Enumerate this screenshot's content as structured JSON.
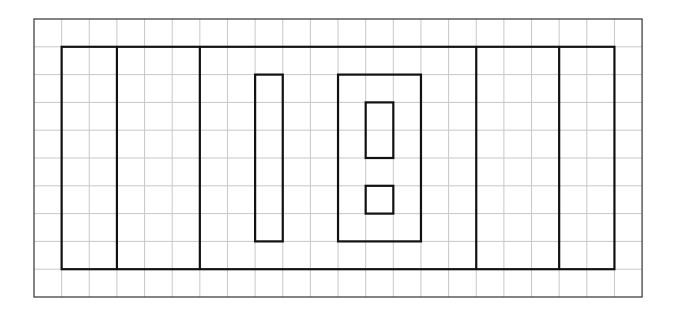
{
  "diagram": {
    "type": "grid-with-rectangles",
    "grid": {
      "origin_px": [
        34,
        19
      ],
      "cols": 22,
      "rows": 10,
      "cell_w": 27.64,
      "cell_h": 27.8,
      "line_color": "#c8c8c8",
      "border_color": "#333333"
    },
    "shape_stroke": "#111111",
    "shapes": [
      {
        "name": "outer-field-rect",
        "col": 1,
        "row": 1,
        "w": 20,
        "h": 8
      },
      {
        "name": "left-end-zone-divider",
        "type": "vline",
        "col": 3,
        "row": 1,
        "h": 8
      },
      {
        "name": "left-inner-divider",
        "type": "vline",
        "col": 6,
        "row": 1,
        "h": 8
      },
      {
        "name": "right-inner-divider",
        "type": "vline",
        "col": 16,
        "row": 1,
        "h": 8
      },
      {
        "name": "right-end-zone-divider",
        "type": "vline",
        "col": 19,
        "row": 1,
        "h": 8
      },
      {
        "name": "tall-narrow-rect",
        "col": 8,
        "row": 2,
        "w": 1,
        "h": 6
      },
      {
        "name": "center-large-rect",
        "col": 11,
        "row": 2,
        "w": 3,
        "h": 6
      },
      {
        "name": "center-upper-inner-rect",
        "col": 12,
        "row": 3,
        "w": 1,
        "h": 2
      },
      {
        "name": "center-lower-small-square",
        "col": 12,
        "row": 6,
        "w": 1,
        "h": 1
      }
    ]
  }
}
